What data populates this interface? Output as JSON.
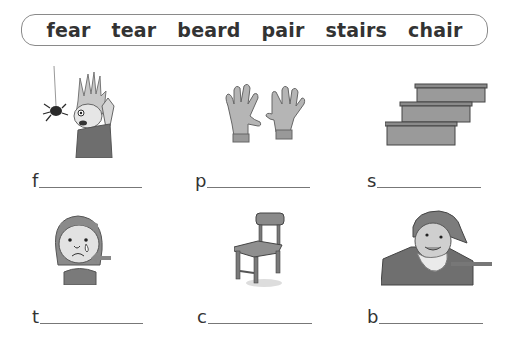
{
  "word_bank": [
    "fear",
    "tear",
    "beard",
    "pair",
    "stairs",
    "chair"
  ],
  "exercises": [
    {
      "picture": "scared-boy-with-spider",
      "first_letter": "f"
    },
    {
      "picture": "pair-of-gloves",
      "first_letter": "p"
    },
    {
      "picture": "stairs",
      "first_letter": "s"
    },
    {
      "picture": "crying-girl-with-tear-arrow",
      "first_letter": "t"
    },
    {
      "picture": "chair",
      "first_letter": "c"
    },
    {
      "picture": "man-with-beard-arrow",
      "first_letter": "b"
    }
  ]
}
